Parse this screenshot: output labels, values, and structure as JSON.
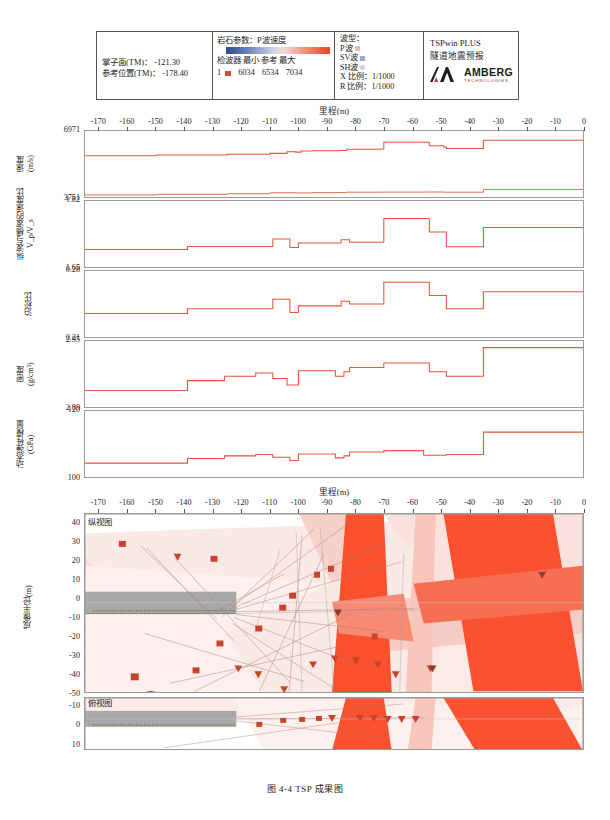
{
  "legend": {
    "face": {
      "line1": "掌子面(TM)： -121.30",
      "line2": "参考位置(TM)： -178.40"
    },
    "rock": {
      "title": "岩石参数：P波速度",
      "header": "检波器  最小  参考  最大",
      "channel": "1",
      "min": "6034",
      "ref": "6534",
      "max": "7034"
    },
    "wave": {
      "title": "波型：",
      "p": "P波",
      "sv": "SV波",
      "sh": "SH波",
      "xscale": "X 比例：1/1000",
      "rscale": "R 比例：1/1000"
    },
    "brand": {
      "line1": "TSPwin PLUS",
      "line2": "隧道地震预报",
      "name": "AMBERG",
      "sub": "TECHNOLOGIES"
    }
  },
  "axes": {
    "x_title": "里程(m)",
    "x_ticks": [
      "-170",
      "-160",
      "-150",
      "-140",
      "-130",
      "-120",
      "-110",
      "-100",
      "-90",
      "-80",
      "-70",
      "-60",
      "-50",
      "-40",
      "-30",
      "-20",
      "-10",
      "0"
    ],
    "imaging_y_title": "成像半径(m)",
    "imaging_y_ticks": [
      "40",
      "30",
      "20",
      "10",
      "0",
      "-10",
      "-20",
      "-30",
      "-40",
      "-50"
    ],
    "plan_y_ticks": [
      "-10",
      "0",
      "10"
    ],
    "view_section": "纵视图",
    "view_plan": "俯视图"
  },
  "panels": [
    {
      "id": "velocity",
      "ylabel": "速度\n(m/s)",
      "ymax": "6971",
      "ymin": "3751"
    },
    {
      "id": "vp_vs",
      "ylabel": "纵波与横波的速度比\nV_p/V_s",
      "ymax": "1.82",
      "ymin": "1.65"
    },
    {
      "id": "poisson",
      "ylabel": "泊松比",
      "ymax": "0.28",
      "ymin": "0.21"
    },
    {
      "id": "density",
      "ylabel": "密度\n(g/cm³)",
      "ymax": "2.95",
      "ymin": "2.89"
    },
    {
      "id": "modulus",
      "ylabel": "动态弹性模量\n(GPa)",
      "ymax": "120",
      "ymin": "100"
    }
  ],
  "caption": "图 4-4   TSP 成果图",
  "colors": {
    "trace": "#e8553a",
    "grid": "#c9c9c9",
    "frame": "#9a9a9a",
    "marker": "#c8452b",
    "tunnel": "#a9a9a9",
    "reflector_strong": "#fa5230",
    "reflector_weak": "#f4cfc8"
  },
  "chart_data": {
    "type": "line",
    "title": "TSP 成果图",
    "xlabel": "里程(m)",
    "xlim": [
      -175,
      0
    ],
    "grid": true,
    "legend": "none",
    "series": [
      {
        "name": "速度 Vp (m/s)",
        "ylabel": "速度 (m/s)",
        "ylim": [
          3751,
          6971
        ],
        "step": true,
        "x": [
          -175,
          -150,
          -125,
          -110,
          -104,
          -101,
          -99,
          -95,
          -86,
          -83,
          -71,
          -70,
          -55,
          -54,
          -49,
          -48,
          -36,
          -35,
          0
        ],
        "values": [
          5760,
          5800,
          5840,
          5880,
          5960,
          5940,
          6000,
          6010,
          6020,
          6080,
          6090,
          6420,
          6420,
          6250,
          6190,
          6120,
          6120,
          6520,
          6520
        ]
      },
      {
        "name": "速度 Vs (m/s)",
        "ylabel": "速度 (m/s)",
        "ylim": [
          3751,
          6971
        ],
        "step": true,
        "x": [
          -175,
          -150,
          -125,
          -110,
          -101,
          -95,
          -86,
          -83,
          -71,
          -55,
          -49,
          -36,
          -35,
          0
        ],
        "values": [
          3850,
          3880,
          3910,
          3960,
          3950,
          3965,
          3970,
          3985,
          3990,
          3995,
          3985,
          3985,
          4120,
          4120
        ]
      },
      {
        "name": "纵波与横波的速度比 Vp/Vs",
        "ylabel": "Vp/Vs",
        "ylim": [
          1.65,
          1.82
        ],
        "step": true,
        "x": [
          -175,
          -140,
          -139,
          -110,
          -109,
          -104,
          -103,
          -101,
          -100,
          -86,
          -85,
          -83,
          -82,
          -71,
          -70,
          -55,
          -54,
          -49,
          -48,
          -36,
          -35,
          0
        ],
        "values": [
          1.695,
          1.695,
          1.703,
          1.703,
          1.722,
          1.722,
          1.7,
          1.7,
          1.712,
          1.712,
          1.72,
          1.72,
          1.714,
          1.714,
          1.775,
          1.775,
          1.74,
          1.74,
          1.702,
          1.702,
          1.752,
          1.752
        ]
      },
      {
        "name": "泊松比",
        "ylabel": "泊松比",
        "ylim": [
          0.21,
          0.28
        ],
        "step": true,
        "x": [
          -175,
          -140,
          -139,
          -110,
          -109,
          -104,
          -103,
          -101,
          -100,
          -86,
          -85,
          -83,
          -82,
          -71,
          -70,
          -55,
          -54,
          -49,
          -48,
          -36,
          -35,
          0
        ],
        "values": [
          0.235,
          0.235,
          0.24,
          0.24,
          0.25,
          0.25,
          0.236,
          0.236,
          0.243,
          0.243,
          0.248,
          0.248,
          0.245,
          0.245,
          0.268,
          0.268,
          0.254,
          0.254,
          0.24,
          0.24,
          0.258,
          0.258
        ]
      },
      {
        "name": "密度",
        "ylabel": "密度 (g/cm³)",
        "ylim": [
          2.89,
          2.95
        ],
        "step": true,
        "x": [
          -175,
          -140,
          -139,
          -127,
          -126,
          -116,
          -115,
          -110,
          -109,
          -105,
          -104,
          -101,
          -100,
          -88,
          -87,
          -85,
          -84,
          -83,
          -82,
          -71,
          -70,
          -55,
          -54,
          -49,
          -48,
          -36,
          -35,
          0
        ],
        "values": [
          2.905,
          2.905,
          2.914,
          2.914,
          2.918,
          2.918,
          2.921,
          2.921,
          2.916,
          2.916,
          2.91,
          2.91,
          2.923,
          2.923,
          2.918,
          2.918,
          2.922,
          2.922,
          2.926,
          2.926,
          2.93,
          2.93,
          2.922,
          2.922,
          2.918,
          2.918,
          2.944,
          2.944
        ]
      },
      {
        "name": "动态弹性模量",
        "ylabel": "动态弹性模量 (GPa)",
        "ylim": [
          100,
          120
        ],
        "step": true,
        "x": [
          -175,
          -140,
          -139,
          -127,
          -126,
          -116,
          -115,
          -110,
          -109,
          -104,
          -103,
          -101,
          -100,
          -88,
          -87,
          -85,
          -84,
          -83,
          -82,
          -71,
          -70,
          -57,
          -56,
          -49,
          -48,
          -36,
          -35,
          0
        ],
        "values": [
          104.2,
          104.2,
          105.6,
          105.6,
          106.4,
          106.4,
          106.8,
          106.8,
          106.0,
          106.0,
          105.0,
          105.0,
          107.0,
          107.0,
          105.8,
          105.8,
          106.4,
          106.4,
          107.6,
          107.6,
          108.0,
          108.0,
          106.6,
          106.6,
          106.8,
          106.8,
          113.6,
          113.6
        ]
      }
    ],
    "imaging": {
      "type": "heatmap",
      "ylabel": "成像半径(m)",
      "ylim": [
        -50,
        45
      ],
      "xlim": [
        -175,
        0
      ],
      "tunnel_span": [
        -175,
        -121.3
      ],
      "reflector_count": 24
    }
  }
}
